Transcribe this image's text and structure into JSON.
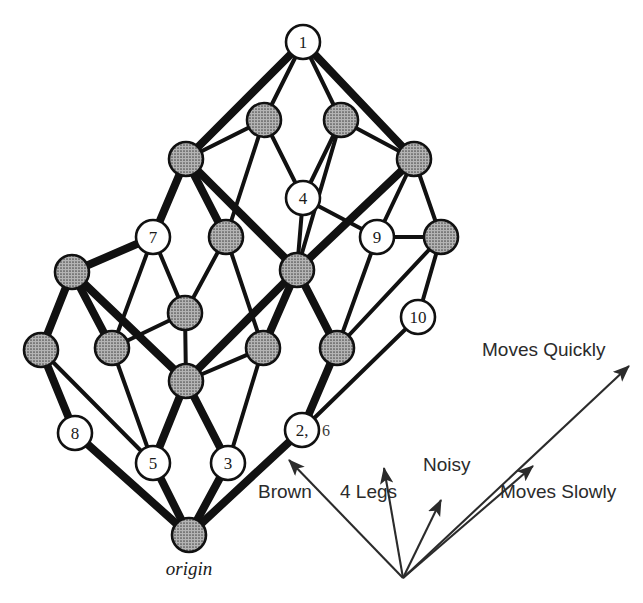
{
  "figure": {
    "origin_label": "origin",
    "colors": {
      "node_filled": "#9a9a9a",
      "node_empty": "#ffffff",
      "node_stroke": "#111111",
      "edge": "#111111",
      "text": "#1a1a1a",
      "background": "#ffffff"
    }
  },
  "nodes": [
    {
      "id": "n1",
      "label": "1",
      "extra": "",
      "filled": false,
      "x": 303,
      "y": 42
    },
    {
      "id": "n2",
      "label": "",
      "extra": "",
      "filled": true,
      "x": 264,
      "y": 120
    },
    {
      "id": "n3",
      "label": "",
      "extra": "",
      "filled": true,
      "x": 341,
      "y": 120
    },
    {
      "id": "n4",
      "label": "",
      "extra": "",
      "filled": true,
      "x": 186,
      "y": 159
    },
    {
      "id": "n5",
      "label": "",
      "extra": "",
      "filled": true,
      "x": 414,
      "y": 159
    },
    {
      "id": "n6",
      "label": "4",
      "extra": "",
      "filled": false,
      "x": 303,
      "y": 198
    },
    {
      "id": "n7",
      "label": "7",
      "extra": "",
      "filled": false,
      "x": 153,
      "y": 237
    },
    {
      "id": "n8",
      "label": "",
      "extra": "",
      "filled": true,
      "x": 226,
      "y": 237
    },
    {
      "id": "n9",
      "label": "9",
      "extra": "",
      "filled": false,
      "x": 377,
      "y": 237
    },
    {
      "id": "n10",
      "label": "",
      "extra": "",
      "filled": true,
      "x": 441,
      "y": 237
    },
    {
      "id": "n11",
      "label": "",
      "extra": "",
      "filled": true,
      "x": 72,
      "y": 272
    },
    {
      "id": "n12",
      "label": "",
      "extra": "",
      "filled": true,
      "x": 297,
      "y": 270
    },
    {
      "id": "n13",
      "label": "",
      "extra": "",
      "filled": true,
      "x": 185,
      "y": 313
    },
    {
      "id": "n14",
      "label": "10",
      "extra": "",
      "filled": false,
      "x": 418,
      "y": 317
    },
    {
      "id": "n15",
      "label": "",
      "extra": "",
      "filled": true,
      "x": 41,
      "y": 350
    },
    {
      "id": "n16",
      "label": "",
      "extra": "",
      "filled": true,
      "x": 112,
      "y": 348
    },
    {
      "id": "n17",
      "label": "",
      "extra": "",
      "filled": true,
      "x": 263,
      "y": 348
    },
    {
      "id": "n18",
      "label": "",
      "extra": "",
      "filled": true,
      "x": 337,
      "y": 348
    },
    {
      "id": "n19",
      "label": "",
      "extra": "",
      "filled": true,
      "x": 186,
      "y": 381
    },
    {
      "id": "n20",
      "label": "8",
      "extra": "",
      "filled": false,
      "x": 75,
      "y": 433
    },
    {
      "id": "n21",
      "label": "2,",
      "extra": "6",
      "filled": false,
      "x": 302,
      "y": 430
    },
    {
      "id": "n22",
      "label": "5",
      "extra": "",
      "filled": false,
      "x": 153,
      "y": 463
    },
    {
      "id": "n23",
      "label": "3",
      "extra": "",
      "filled": false,
      "x": 228,
      "y": 463
    },
    {
      "id": "n24",
      "label": "",
      "extra": "",
      "filled": true,
      "x": 189,
      "y": 535
    }
  ],
  "edges": [
    {
      "from": "n1",
      "to": "n2",
      "weight": "thin"
    },
    {
      "from": "n1",
      "to": "n3",
      "weight": "thin"
    },
    {
      "from": "n1",
      "to": "n4",
      "weight": "thick"
    },
    {
      "from": "n1",
      "to": "n5",
      "weight": "thick"
    },
    {
      "from": "n2",
      "to": "n4",
      "weight": "thin"
    },
    {
      "from": "n2",
      "to": "n6",
      "weight": "thin"
    },
    {
      "from": "n2",
      "to": "n8",
      "weight": "thin"
    },
    {
      "from": "n3",
      "to": "n5",
      "weight": "thin"
    },
    {
      "from": "n3",
      "to": "n6",
      "weight": "thin"
    },
    {
      "from": "n3",
      "to": "n12",
      "weight": "thin"
    },
    {
      "from": "n4",
      "to": "n7",
      "weight": "thick"
    },
    {
      "from": "n4",
      "to": "n8",
      "weight": "thick"
    },
    {
      "from": "n4",
      "to": "n12",
      "weight": "thick"
    },
    {
      "from": "n5",
      "to": "n9",
      "weight": "thin"
    },
    {
      "from": "n5",
      "to": "n10",
      "weight": "thin"
    },
    {
      "from": "n5",
      "to": "n12",
      "weight": "thick"
    },
    {
      "from": "n6",
      "to": "n12",
      "weight": "thin"
    },
    {
      "from": "n6",
      "to": "n9",
      "weight": "thin"
    },
    {
      "from": "n7",
      "to": "n11",
      "weight": "thick"
    },
    {
      "from": "n7",
      "to": "n13",
      "weight": "thin"
    },
    {
      "from": "n7",
      "to": "n16",
      "weight": "thin"
    },
    {
      "from": "n8",
      "to": "n13",
      "weight": "thin"
    },
    {
      "from": "n8",
      "to": "n17",
      "weight": "thin"
    },
    {
      "from": "n9",
      "to": "n10",
      "weight": "thin"
    },
    {
      "from": "n9",
      "to": "n18",
      "weight": "thin"
    },
    {
      "from": "n10",
      "to": "n14",
      "weight": "thin"
    },
    {
      "from": "n10",
      "to": "n18",
      "weight": "thin"
    },
    {
      "from": "n11",
      "to": "n15",
      "weight": "thick"
    },
    {
      "from": "n11",
      "to": "n16",
      "weight": "thick"
    },
    {
      "from": "n11",
      "to": "n19",
      "weight": "thick"
    },
    {
      "from": "n12",
      "to": "n17",
      "weight": "thick"
    },
    {
      "from": "n12",
      "to": "n18",
      "weight": "thick"
    },
    {
      "from": "n12",
      "to": "n19",
      "weight": "thick"
    },
    {
      "from": "n13",
      "to": "n16",
      "weight": "thin"
    },
    {
      "from": "n13",
      "to": "n19",
      "weight": "thin"
    },
    {
      "from": "n14",
      "to": "n21",
      "weight": "thin"
    },
    {
      "from": "n15",
      "to": "n20",
      "weight": "thick"
    },
    {
      "from": "n15",
      "to": "n22",
      "weight": "thin"
    },
    {
      "from": "n16",
      "to": "n22",
      "weight": "thin"
    },
    {
      "from": "n17",
      "to": "n19",
      "weight": "thin"
    },
    {
      "from": "n17",
      "to": "n23",
      "weight": "thin"
    },
    {
      "from": "n18",
      "to": "n21",
      "weight": "thick"
    },
    {
      "from": "n19",
      "to": "n22",
      "weight": "thick"
    },
    {
      "from": "n19",
      "to": "n23",
      "weight": "thick"
    },
    {
      "from": "n20",
      "to": "n24",
      "weight": "thick"
    },
    {
      "from": "n21",
      "to": "n24",
      "weight": "thick"
    },
    {
      "from": "n22",
      "to": "n24",
      "weight": "thick"
    },
    {
      "from": "n23",
      "to": "n24",
      "weight": "thick"
    }
  ],
  "attributes": {
    "hub": {
      "x": 403,
      "y": 578
    },
    "items": [
      {
        "id": "brown",
        "label": "Brown",
        "label_x": 258,
        "label_y": 498,
        "tip_x": 289,
        "tip_y": 460
      },
      {
        "id": "four-legs",
        "label": "4 Legs",
        "label_x": 340,
        "label_y": 498,
        "tip_x": 384,
        "tip_y": 468
      },
      {
        "id": "noisy",
        "label": "Noisy",
        "label_x": 423,
        "label_y": 471,
        "tip_x": 441,
        "tip_y": 500
      },
      {
        "id": "moves-quickly",
        "label": "Moves Quickly",
        "label_x": 482,
        "label_y": 356,
        "tip_x": 629,
        "tip_y": 366
      },
      {
        "id": "moves-slowly",
        "label": "Moves Slowly",
        "label_x": 500,
        "label_y": 498,
        "tip_x": 533,
        "tip_y": 466
      }
    ]
  }
}
